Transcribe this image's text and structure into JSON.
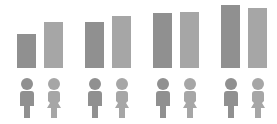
{
  "colors": {
    "male": "#909090",
    "female": "#a6a6a6",
    "background": "#ffffff"
  },
  "chart_data": {
    "type": "bar",
    "title": "",
    "xlabel": "",
    "ylabel": "",
    "categories": [
      "Group 1",
      "Group 2",
      "Group 3",
      "Group 4"
    ],
    "series": [
      {
        "name": "male",
        "icon": "male-person-icon",
        "values": [
          34,
          46,
          55,
          63
        ]
      },
      {
        "name": "female",
        "icon": "female-person-icon",
        "values": [
          46,
          52,
          56,
          60
        ]
      }
    ],
    "ylim": [
      0,
      68
    ],
    "grid": false,
    "legend": "icons below bars"
  }
}
